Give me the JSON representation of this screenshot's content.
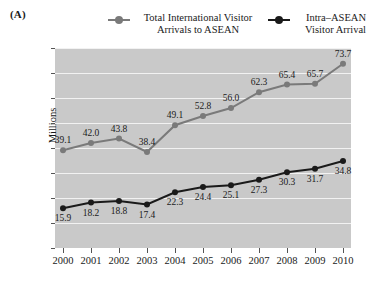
{
  "panel": {
    "label": "(A)"
  },
  "legend": {
    "entries": [
      {
        "name": "total-international",
        "line1": "Total International Visitor",
        "line2": "Arrivals to ASEAN",
        "color": "#7a7a7a",
        "marker": "circle-marker"
      },
      {
        "name": "intra-asean",
        "line1": "Intra–ASEAN",
        "line2": "Visitor Arrival",
        "color": "#1a1a1a",
        "marker": "circle-marker"
      }
    ]
  },
  "chart_data": {
    "type": "line",
    "title": "",
    "xlabel": "",
    "ylabel": "Millions",
    "ylim": [
      0,
      80
    ],
    "yticks": [
      0,
      10,
      20,
      30,
      40,
      50,
      60,
      70,
      80
    ],
    "grid": true,
    "legend_position": "top",
    "plot_background": "#c9c9c9",
    "gridline_color": "#f2f2f2",
    "categories": [
      "2000",
      "2001",
      "2002",
      "2003",
      "2004",
      "2005",
      "2006",
      "2007",
      "2008",
      "2009",
      "2010"
    ],
    "x": [
      2000,
      2001,
      2002,
      2003,
      2004,
      2005,
      2006,
      2007,
      2008,
      2009,
      2010
    ],
    "series": [
      {
        "name": "Total International Visitor Arrivals to ASEAN",
        "color": "#7a7a7a",
        "values": [
          39.1,
          42.0,
          43.8,
          38.4,
          49.1,
          52.8,
          56.0,
          62.3,
          65.4,
          65.7,
          73.7
        ],
        "labels": [
          "39.1",
          "42.0",
          "43.8",
          "38.4",
          "49.1",
          "52.8",
          "56.0",
          "62.3",
          "65.4",
          "65.7",
          "73.7"
        ]
      },
      {
        "name": "Intra–ASEAN Visitor Arrival",
        "color": "#1a1a1a",
        "values": [
          15.9,
          18.2,
          18.8,
          17.4,
          22.3,
          24.4,
          25.1,
          27.3,
          30.3,
          31.7,
          34.8
        ],
        "labels": [
          "15.9",
          "18.2",
          "18.8",
          "17.4",
          "22.3",
          "24.4",
          "25.1",
          "27.3",
          "30.3",
          "31.7",
          "34.8"
        ]
      }
    ]
  }
}
